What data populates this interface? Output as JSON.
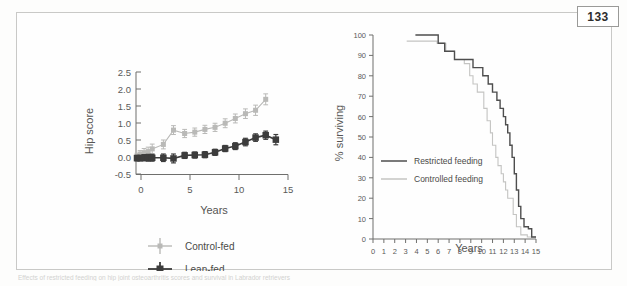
{
  "page": {
    "number": "133",
    "caption_faint": "Effects of restricted feeding on hip joint osteoarthritis scores and survival in Labrador retrievers"
  },
  "chart_data": [
    {
      "type": "line",
      "id": "hip-score-chart",
      "title": "",
      "xlabel": "Years",
      "ylabel": "Hip score",
      "xlim": [
        0,
        15
      ],
      "ylim": [
        -0.5,
        2.5
      ],
      "xticks": [
        0,
        5,
        10,
        15
      ],
      "xtick_labels": [
        "0",
        "5",
        "10",
        "15"
      ],
      "yticks": [
        -0.5,
        0.0,
        0.5,
        1.0,
        1.5,
        2.0,
        2.5
      ],
      "ytick_labels": [
        "-0.5",
        "0.0",
        "0.5",
        "1.0",
        "1.5",
        "2.0",
        "2.5"
      ],
      "grid": false,
      "legend_position": "below",
      "error_bars": true,
      "x": [
        0.1,
        0.4,
        0.8,
        1.2,
        1.6,
        2.7,
        3.7,
        4.8,
        5.8,
        6.8,
        7.8,
        8.8,
        9.8,
        10.8,
        11.8,
        12.8,
        13.8
      ],
      "series": [
        {
          "name": "Control-fed",
          "color": "#b9b9b7",
          "marker": "cross",
          "values": [
            0.02,
            0.1,
            0.14,
            0.17,
            0.25,
            0.38,
            0.8,
            0.7,
            0.74,
            0.82,
            0.88,
            1.0,
            1.14,
            1.28,
            1.38,
            1.7,
            null
          ],
          "errors": [
            0.1,
            0.1,
            0.12,
            0.13,
            0.14,
            0.13,
            0.13,
            0.12,
            0.12,
            0.12,
            0.12,
            0.13,
            0.13,
            0.14,
            0.15,
            0.16,
            null
          ]
        },
        {
          "name": "Lean-fed",
          "color": "#3c3c3c",
          "marker": "square",
          "values": [
            -0.02,
            -0.02,
            -0.01,
            -0.01,
            -0.01,
            -0.01,
            -0.03,
            0.06,
            0.07,
            0.08,
            0.15,
            0.26,
            0.33,
            0.45,
            0.58,
            0.65,
            0.52
          ],
          "errors": [
            0.08,
            0.08,
            0.09,
            0.1,
            0.1,
            0.11,
            0.13,
            0.09,
            0.09,
            0.09,
            0.09,
            0.09,
            0.1,
            0.11,
            0.11,
            0.12,
            0.15
          ]
        }
      ]
    },
    {
      "type": "line",
      "id": "survival-chart",
      "title": "",
      "xlabel": "Years",
      "ylabel": "% surviving",
      "xlim": [
        0,
        15
      ],
      "ylim": [
        0,
        100
      ],
      "xticks": [
        0,
        1,
        2,
        3,
        4,
        5,
        6,
        7,
        8,
        9,
        10,
        11,
        12,
        13,
        14,
        15
      ],
      "xtick_labels": [
        "0",
        "1",
        "2",
        "3",
        "4",
        "5",
        "6",
        "7",
        "8",
        "9",
        "10",
        "11",
        "12",
        "13",
        "14",
        "15"
      ],
      "yticks": [
        0,
        10,
        20,
        30,
        40,
        50,
        60,
        70,
        80,
        90,
        100
      ],
      "ytick_labels": [
        "0",
        "10",
        "20",
        "30",
        "40",
        "50",
        "60",
        "70",
        "80",
        "90",
        "100"
      ],
      "grid": false,
      "legend_position": "inside-left",
      "step": true,
      "series": [
        {
          "name": "Restricted feeding",
          "color": "#4e4e4e",
          "x": [
            3.9,
            6.0,
            6.6,
            7.5,
            8.6,
            9.2,
            9.6,
            10.1,
            10.6,
            11.0,
            11.4,
            11.7,
            12.0,
            12.2,
            12.4,
            12.6,
            12.8,
            13.0,
            13.2,
            13.4,
            13.6,
            13.9,
            14.3,
            14.6,
            15.0
          ],
          "values": [
            100,
            96,
            92,
            88,
            88,
            84,
            84,
            80,
            76,
            72,
            68,
            64,
            60,
            56,
            52,
            46,
            40,
            32,
            24,
            16,
            10,
            6,
            5,
            1,
            1
          ]
        },
        {
          "name": "Controlled feeding",
          "color": "#c4c4c2",
          "x": [
            3.1,
            4.0,
            5.9,
            6.7,
            7.5,
            8.4,
            8.9,
            9.2,
            9.6,
            9.9,
            10.2,
            10.5,
            10.8,
            11.0,
            11.3,
            11.5,
            11.8,
            12.0,
            12.2,
            12.4,
            12.6,
            12.9,
            13.2,
            13.6,
            14.2,
            15.0
          ],
          "values": [
            97,
            97,
            96,
            92,
            88,
            86,
            80,
            76,
            72,
            72,
            64,
            58,
            52,
            46,
            40,
            36,
            32,
            28,
            24,
            20,
            20,
            12,
            6,
            2,
            1,
            1
          ]
        }
      ]
    }
  ]
}
